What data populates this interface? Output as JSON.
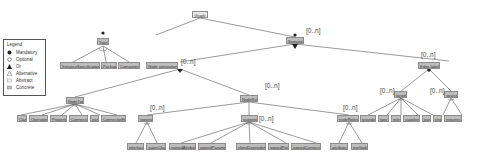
{
  "legend": {
    "title": "Legend:",
    "items": [
      {
        "symbol": "filled-circle",
        "label": "Mandatory"
      },
      {
        "symbol": "open-circle",
        "label": "Optional"
      },
      {
        "symbol": "filled-arc",
        "label": "Or"
      },
      {
        "symbol": "open-arc",
        "label": "Alternative"
      },
      {
        "symbol": "light-box",
        "label": "Abstract"
      },
      {
        "symbol": "grey-box",
        "label": "Concrete"
      }
    ]
  },
  "nodes": {
    "graph": "Graph",
    "type": "Type",
    "semantic": "Semantic",
    "instance_spec": "InstanceSpecification",
    "package": "Package",
    "component": "Component",
    "node_annotation": "Node annotation",
    "node_type": "NodeType",
    "node_role": "NodeRole",
    "edge_label": "Edge label",
    "class": "Class",
    "operation": "Operation",
    "property": "Property",
    "connector": "Connector",
    "port": "port",
    "connector_end": "ConnectorEnd",
    "ingoing": "ingoing",
    "outgoing": "outgoing",
    "node_roles": "nodeRoles",
    "interface": "interface",
    "superclass": "superClass",
    "owned_attribute": "ownedAttribute",
    "owned_parameter": "ownedParameter",
    "client_dependency": "clientDependency",
    "owned_port": "ownedPort",
    "owned_connector": "ownedConnector",
    "attributes": "attributes",
    "methods": "methods",
    "target": "target",
    "source": "source",
    "provides": "provides",
    "type_leaf": "type",
    "role": "role",
    "supplier": "supplier",
    "part": "part",
    "end": "end",
    "requires": "requires"
  },
  "multiplicities": {
    "semantic": "[0..n]",
    "node_annotation": "[0..n]",
    "node_role": "[0..n]",
    "edge_label": "[0..n]",
    "ingoing": "[0..n]",
    "outgoing": "[0..n]",
    "node_roles": "[0..n]",
    "target": "[0..n]",
    "source": "[0..n]"
  },
  "colors": {
    "node_fill": "#bdbdbd",
    "node_border": "#8c8c8c",
    "edge": "#555555"
  }
}
